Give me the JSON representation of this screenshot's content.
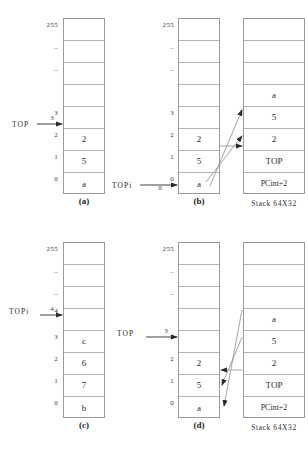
{
  "figure": {
    "stack_label": "Stack 64X32",
    "ink_color": "#2b2b2b",
    "grid_color": "#b4b4b4",
    "border_color": "#9a9a9a"
  },
  "panels": [
    {
      "id": "a",
      "caption": "(a)",
      "memory": {
        "row_labels": [
          "255",
          "..",
          "..",
          "",
          "3",
          "2",
          "1",
          "0"
        ],
        "cells": [
          "",
          "",
          "",
          "",
          "",
          "2",
          "5",
          "a"
        ]
      },
      "pointer": {
        "label": "TOP",
        "index_label": "3",
        "target_row": 4
      }
    },
    {
      "id": "b",
      "caption": "(b)",
      "memory": {
        "row_labels": [
          "255",
          "..",
          "..",
          "",
          "3",
          "2",
          "1",
          "0"
        ],
        "cells": [
          "",
          "",
          "",
          "",
          "",
          "2",
          "5",
          "a"
        ]
      },
      "pointer": {
        "label": "TOPi",
        "index_label": "0",
        "target_row": 7
      },
      "stack": {
        "label": "Stack 64X32",
        "cells": [
          "",
          "",
          "",
          "a",
          "5",
          "2",
          "TOP",
          "PCint+2"
        ]
      },
      "arrows_direction": "memory-to-stack"
    },
    {
      "id": "c",
      "caption": "(c)",
      "memory": {
        "row_labels": [
          "255",
          "..",
          "..",
          "4",
          "3",
          "2",
          "1",
          "0"
        ],
        "cells": [
          "",
          "",
          "",
          "",
          "c",
          "6",
          "7",
          "b"
        ]
      },
      "pointer": {
        "label": "TOPi",
        "index_label": "4",
        "target_row": 3
      }
    },
    {
      "id": "d",
      "caption": "(d)",
      "memory": {
        "row_labels": [
          "255",
          "..",
          "..",
          "",
          "3",
          "2",
          "1",
          "0"
        ],
        "cells": [
          "",
          "",
          "",
          "",
          "",
          "2",
          "5",
          "a"
        ]
      },
      "pointer": {
        "label": "TOP",
        "index_label": "3",
        "target_row": 4
      },
      "stack": {
        "label": "Stack 64X32",
        "cells": [
          "",
          "",
          "",
          "a",
          "5",
          "2",
          "TOP",
          "PCint+2"
        ]
      },
      "arrows_direction": "stack-to-memory"
    }
  ]
}
